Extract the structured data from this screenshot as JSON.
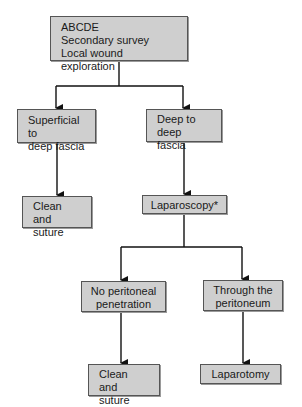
{
  "diagram": {
    "type": "flowchart",
    "nodes": {
      "start": {
        "lines": [
          "ABCDE",
          "Secondary survey",
          "Local wound exploration"
        ]
      },
      "superficial": {
        "lines": [
          "Superficial to",
          "deep fascia"
        ]
      },
      "deep": {
        "lines": [
          "Deep to",
          "deep fascia"
        ]
      },
      "clean_suture_1": {
        "lines": [
          "Clean and",
          "suture"
        ]
      },
      "laparoscopy": {
        "lines": [
          "Laparoscopy*"
        ]
      },
      "no_penetration": {
        "lines": [
          "No peritoneal",
          "penetration"
        ]
      },
      "through_peritoneum": {
        "lines": [
          "Through the",
          "peritoneum"
        ]
      },
      "clean_suture_2": {
        "lines": [
          "Clean and",
          "suture"
        ]
      },
      "laparotomy": {
        "lines": [
          "Laparotomy"
        ]
      }
    },
    "edges": [
      [
        "start",
        "superficial"
      ],
      [
        "start",
        "deep"
      ],
      [
        "superficial",
        "clean_suture_1"
      ],
      [
        "deep",
        "laparoscopy"
      ],
      [
        "laparoscopy",
        "no_penetration"
      ],
      [
        "laparoscopy",
        "through_peritoneum"
      ],
      [
        "no_penetration",
        "clean_suture_2"
      ],
      [
        "through_peritoneum",
        "laparotomy"
      ]
    ],
    "colors": {
      "box_fill": "#cfcfcf",
      "box_border": "#555555",
      "line": "#111111"
    }
  }
}
